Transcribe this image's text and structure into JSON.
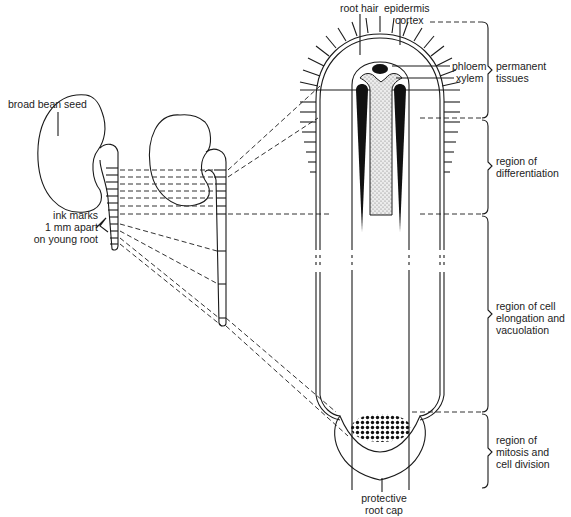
{
  "figure": {
    "colors": {
      "ink": "#1a1a1a",
      "background": "#ffffff",
      "xylem_fill": "#d9d9d9"
    }
  },
  "labels": {
    "seed": "broad bean seed",
    "ink_marks": [
      "ink marks",
      "1 mm apart",
      "on young root"
    ],
    "root_hair": "root hair",
    "epidermis": "epidermis",
    "cortex": "cortex",
    "phloem": "phloem",
    "xylem": "xylem",
    "root_cap": [
      "protective",
      "root cap"
    ]
  },
  "regions": [
    {
      "id": "permanent",
      "lines": [
        "permanent",
        "tissues"
      ]
    },
    {
      "id": "differentiation",
      "lines": [
        "region of",
        "differentiation"
      ]
    },
    {
      "id": "elongation",
      "lines": [
        "region of cell",
        "elongation and",
        "vacuolation"
      ]
    },
    {
      "id": "mitosis",
      "lines": [
        "region of",
        "mitosis and",
        "cell division"
      ]
    }
  ]
}
